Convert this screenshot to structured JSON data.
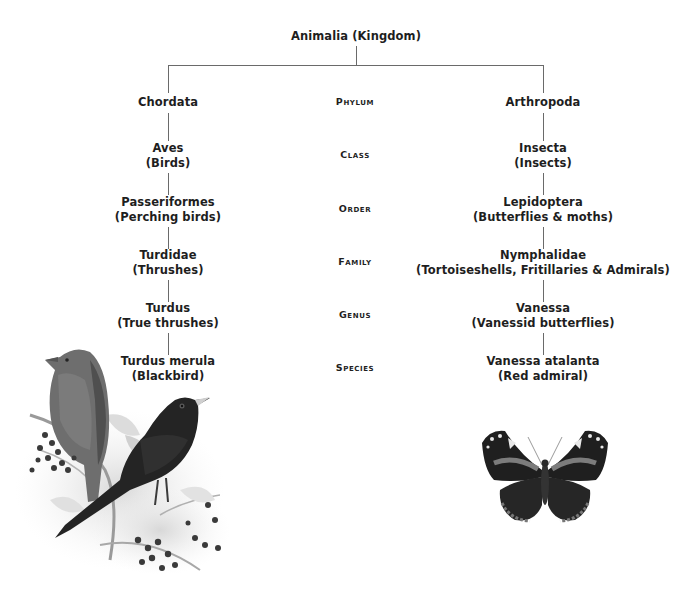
{
  "kingdom": {
    "label": "Animalia (Kingdom)"
  },
  "ranks": [
    "Phylum",
    "Class",
    "Order",
    "Family",
    "Genus",
    "Species"
  ],
  "left_branch": {
    "levels": [
      {
        "name": "Chordata",
        "common": ""
      },
      {
        "name": "Aves",
        "common": "(Birds)"
      },
      {
        "name": "Passeriformes",
        "common": "(Perching birds)"
      },
      {
        "name": "Turdidae",
        "common": "(Thrushes)"
      },
      {
        "name": "Turdus",
        "common": "(True thrushes)"
      },
      {
        "name": "Turdus merula",
        "common": "(Blackbird)"
      }
    ],
    "illustration": "blackbird-illustration"
  },
  "right_branch": {
    "levels": [
      {
        "name": "Arthropoda",
        "common": ""
      },
      {
        "name": "Insecta",
        "common": "(Insects)"
      },
      {
        "name": "Lepidoptera",
        "common": "(Butterflies & moths)"
      },
      {
        "name": "Nymphalidae",
        "common": "(Tortoiseshells, Fritillaries & Admirals)"
      },
      {
        "name": "Vanessa",
        "common": "(Vanessid butterflies)"
      },
      {
        "name": "Vanessa atalanta",
        "common": "(Red admiral)"
      }
    ],
    "illustration": "red-admiral-illustration"
  },
  "colors": {
    "text": "#1e1e1e",
    "line": "#6a6a6a"
  }
}
